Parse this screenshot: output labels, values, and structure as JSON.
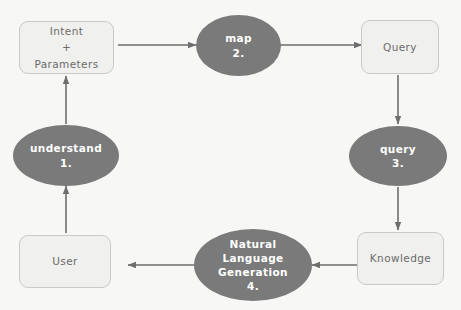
{
  "diagram": {
    "background_color": "#f7f7f5",
    "box_fill": "#f0f0ee",
    "box_border": "#c9c9c6",
    "box_text_color": "#6b6b6b",
    "ellipse_fill": "#797a79",
    "ellipse_text_color": "#ffffff",
    "arrow_color": "#6e6e6e",
    "nodes": [
      {
        "id": "intent",
        "shape": "box",
        "label": "Intent\n+\nParameters"
      },
      {
        "id": "map",
        "shape": "ellipse",
        "label": "map\n2."
      },
      {
        "id": "query_box",
        "shape": "box",
        "label": "Query"
      },
      {
        "id": "query_op",
        "shape": "ellipse",
        "label": "query\n3."
      },
      {
        "id": "knowledge",
        "shape": "box",
        "label": "Knowledge"
      },
      {
        "id": "nlg",
        "shape": "ellipse",
        "label": "Natural\nLanguage\nGeneration\n4."
      },
      {
        "id": "user",
        "shape": "box",
        "label": "User"
      },
      {
        "id": "understand",
        "shape": "ellipse",
        "label": "understand\n1."
      }
    ],
    "edges": [
      {
        "from": "intent",
        "to": "map",
        "direction": "right"
      },
      {
        "from": "map",
        "to": "query_box",
        "direction": "right"
      },
      {
        "from": "query_box",
        "to": "query_op",
        "direction": "down"
      },
      {
        "from": "query_op",
        "to": "knowledge",
        "direction": "down"
      },
      {
        "from": "knowledge",
        "to": "nlg",
        "direction": "left"
      },
      {
        "from": "nlg",
        "to": "user",
        "direction": "left"
      },
      {
        "from": "user",
        "to": "understand",
        "direction": "up"
      },
      {
        "from": "understand",
        "to": "intent",
        "direction": "up"
      }
    ]
  }
}
